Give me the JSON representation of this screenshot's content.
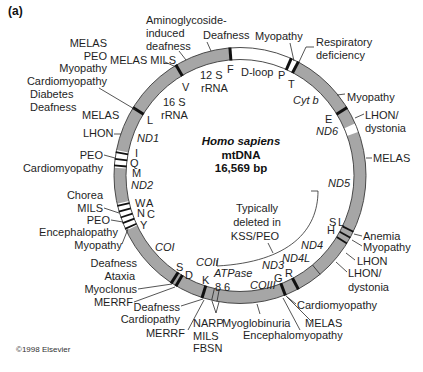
{
  "figure": {
    "panel_label": "(a)",
    "copyright": "©1998 Elsevier",
    "ring_color": "#a6a6a6",
    "marker_color": "#111111"
  },
  "center": {
    "species": "Homo sapiens",
    "molecule": "mtDNA",
    "length": "16,569 bp"
  },
  "genes": {
    "rrna12s": [
      "12 S",
      "rRNA"
    ],
    "rrna16s": [
      "16 S",
      "rRNA"
    ],
    "dloop": "D-loop",
    "cytb": "Cyt b",
    "nd1": "ND1",
    "nd2": "ND2",
    "nd3": "ND3",
    "nd4": "ND4",
    "nd4l": "ND4L",
    "nd5": "ND5",
    "nd6": "ND6",
    "coi": "COI",
    "coii": "COII",
    "coiii": "COIII",
    "atpase": "ATPase",
    "atp8": "8",
    "atp6": "6"
  },
  "trna": {
    "F": "F",
    "V": "V",
    "L1": "L",
    "I": "I",
    "Q": "Q",
    "M": "M",
    "W": "W",
    "A": "A",
    "N": "N",
    "C": "C",
    "Y": "Y",
    "S1": "S",
    "D": "D",
    "K": "K",
    "G": "G",
    "R": "R",
    "H": "H",
    "S2": "S",
    "L2": "L",
    "E": "E",
    "T": "T",
    "P": "P"
  },
  "deletion_note": [
    "Typically",
    "deleted in",
    "KSS/PEO"
  ],
  "diseases": {
    "aminoglycoside": [
      "Aminoglycoside-",
      "induced",
      "deafness"
    ],
    "rrna12s_deafness": "Deafness",
    "dloop_myopathy": "Myopathy",
    "respiratory": [
      "Respiratory",
      "deficiency"
    ],
    "trna_leu": [
      "MELAS",
      "PEO",
      "Myopathy",
      "Cardiomyopathy",
      "Diabetes",
      "Deafness"
    ],
    "trna_val": "MELAS MILS",
    "leu_melas": "MELAS",
    "nd1_lhon": "LHON",
    "trna_ile": [
      "PEO",
      "Cardiomyopathy"
    ],
    "trna_wancy": [
      "Chorea",
      "MILS",
      "PEO",
      "Encephalopathy",
      "Myopathy"
    ],
    "trna_ser_asp": [
      "Deafness",
      "Ataxia",
      "Myoclonus",
      "MERRF"
    ],
    "trna_lys": [
      "Deafness",
      "Cardiopathy",
      "MERRF"
    ],
    "atpase": [
      "NARP",
      "MILS",
      "FBSN"
    ],
    "coiii": "Myoglobinuria",
    "trna_gly": [
      "Encephalomyopathy",
      "MELAS",
      "Cardiomyopathy"
    ],
    "nd4": [
      "LHON/",
      "dystonia",
      "LHON"
    ],
    "trna_his": [
      "Myopathy",
      "Anemia"
    ],
    "nd5_melas": "MELAS",
    "nd6": [
      "LHON/",
      "dystonia"
    ],
    "cytb_myopathy": "Myopathy"
  }
}
